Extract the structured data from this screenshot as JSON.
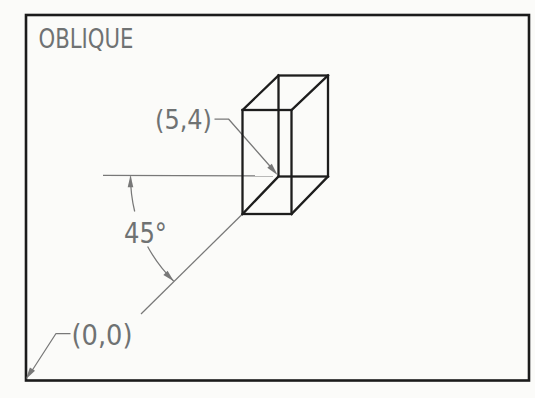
{
  "drawing": {
    "title": "OBLIQUE",
    "labels": {
      "box_position": "(5,4)",
      "angle": "45°",
      "origin": "(0,0)"
    },
    "colors": {
      "frame_and_box": "#1d1d1d",
      "annotation": "#787878",
      "paper": "#fbfbf9"
    }
  }
}
